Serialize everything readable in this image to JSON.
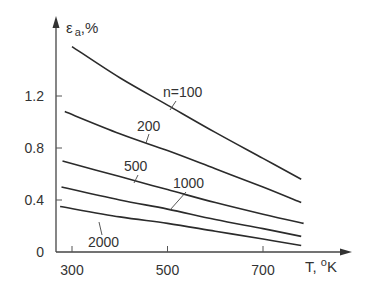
{
  "chart_data": {
    "type": "line",
    "title": "",
    "xlabel": "T, °K",
    "ylabel": "εa, %",
    "ylabel_main": "ε",
    "ylabel_sub": "a",
    "ylabel_unit": ",%",
    "xlabel_main": "T, ",
    "xlabel_deg": "o",
    "xlabel_unit": "K",
    "xlim": [
      265,
      790
    ],
    "ylim": [
      0,
      1.7
    ],
    "xticks": [
      300,
      500,
      700
    ],
    "xtick_labels": [
      "300",
      "500",
      "700"
    ],
    "yticks": [
      0,
      0.4,
      0.8,
      1.2
    ],
    "ytick_labels": [
      "0",
      "0.4",
      "0.8",
      "1.2"
    ],
    "grid": false,
    "legend": "inline labels",
    "series": [
      {
        "name": "n=100",
        "label": "n=100",
        "x": [
          300,
          400,
          500,
          600,
          700,
          780
        ],
        "values": [
          1.58,
          1.34,
          1.13,
          0.92,
          0.72,
          0.56
        ]
      },
      {
        "name": "n=200",
        "label": "200",
        "x": [
          285,
          400,
          500,
          600,
          700,
          780
        ],
        "values": [
          1.08,
          0.91,
          0.78,
          0.64,
          0.5,
          0.38
        ]
      },
      {
        "name": "n=500",
        "label": "500",
        "x": [
          280,
          400,
          500,
          600,
          700,
          785
        ],
        "values": [
          0.7,
          0.58,
          0.48,
          0.38,
          0.29,
          0.22
        ]
      },
      {
        "name": "n=1000",
        "label": "1000",
        "x": [
          278,
          400,
          500,
          600,
          700,
          780
        ],
        "values": [
          0.5,
          0.4,
          0.33,
          0.25,
          0.18,
          0.12
        ]
      },
      {
        "name": "n=2000",
        "label": "2000",
        "x": [
          275,
          400,
          500,
          600,
          700,
          780
        ],
        "values": [
          0.35,
          0.27,
          0.22,
          0.16,
          0.1,
          0.05
        ]
      }
    ]
  }
}
